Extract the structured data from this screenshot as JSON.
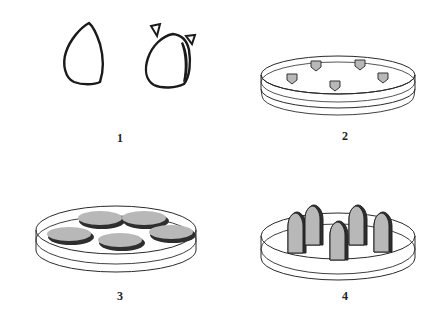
{
  "figure": {
    "panels": [
      {
        "id": "1",
        "label": "1",
        "description": "Two seeds (outline drawings), the second with two small cut pieces at the top"
      },
      {
        "id": "2",
        "label": "2",
        "description": "Petri dish with five small cut pentagonal explants"
      },
      {
        "id": "3",
        "label": "3",
        "description": "Petri dish with five flat oval discs (callus)"
      },
      {
        "id": "4",
        "label": "4",
        "description": "Petri dish with five upright bullet-shaped shoots"
      }
    ],
    "colors": {
      "stroke": "#1a1a1a",
      "fill_gray": "#b8b8b8",
      "shadow": "#3a3a3a",
      "background": "#ffffff"
    }
  }
}
